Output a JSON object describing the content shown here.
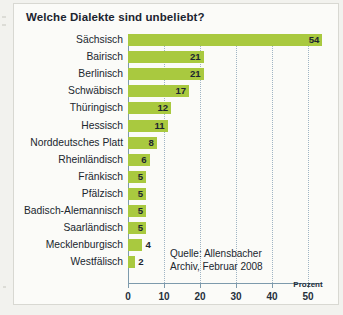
{
  "title": "Welche Dialekte sind unbeliebt?",
  "source_note": "Quelle: Allensbacher\nArchiv, Februar 2008",
  "axis_unit": "Prozent",
  "chart_data": {
    "type": "bar",
    "orientation": "horizontal",
    "title": "Welche Dialekte sind unbeliebt?",
    "xlabel": "Prozent",
    "ylabel": "",
    "xlim": [
      0,
      50
    ],
    "xticks": [
      0,
      10,
      20,
      30,
      40,
      50
    ],
    "xtick_labels": [
      "0",
      "10",
      "20",
      "30",
      "40",
      "50"
    ],
    "grid": true,
    "legend": false,
    "bar_color": "#a9c93f",
    "annotation": "Quelle: Allensbacher Archiv, Februar 2008",
    "categories": [
      "Sächsisch",
      "Bairisch",
      "Berlinisch",
      "Schwäbisch",
      "Thüringisch",
      "Hessisch",
      "Norddeutsches Platt",
      "Rheinländisch",
      "Fränkisch",
      "Pfälzisch",
      "Badisch-Alemannisch",
      "Saarländisch",
      "Mecklenburgisch",
      "Westfälisch"
    ],
    "values": [
      54,
      21,
      21,
      17,
      12,
      11,
      8,
      6,
      5,
      5,
      5,
      5,
      4,
      2
    ],
    "value_labels": [
      "54",
      "21",
      "21",
      "17",
      "12",
      "11",
      "8",
      "6",
      "5",
      "5",
      "5",
      "5",
      "4",
      "2"
    ]
  }
}
